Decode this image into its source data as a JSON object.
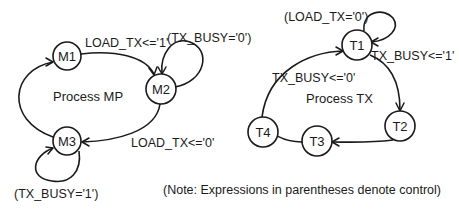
{
  "processes": [
    {
      "name": "Process MP",
      "states": [
        "M1",
        "M2",
        "M3"
      ],
      "transitions": [
        {
          "from": "M1",
          "to": "M2",
          "label": "LOAD_TX<='1'"
        },
        {
          "from": "M2",
          "to": "M2",
          "label": "(TX_BUSY='0')"
        },
        {
          "from": "M2",
          "to": "M3",
          "label": "LOAD_TX<='0'"
        },
        {
          "from": "M3",
          "to": "M3",
          "label": "(TX_BUSY='1')"
        },
        {
          "from": "M3",
          "to": "M1",
          "label": ""
        }
      ]
    },
    {
      "name": "Process TX",
      "states": [
        "T1",
        "T2",
        "T3",
        "T4"
      ],
      "transitions": [
        {
          "from": "T1",
          "to": "T1",
          "label": "(LOAD_TX='0')"
        },
        {
          "from": "T1",
          "to": "T2",
          "label": "TX_BUSY<='1'"
        },
        {
          "from": "T2",
          "to": "T3",
          "label": ""
        },
        {
          "from": "T3",
          "to": "T4",
          "label": ""
        },
        {
          "from": "T4",
          "to": "T1",
          "label": "TX_BUSY<='0'"
        }
      ]
    }
  ],
  "note": "(Note: Expressions in parentheses denote control)"
}
